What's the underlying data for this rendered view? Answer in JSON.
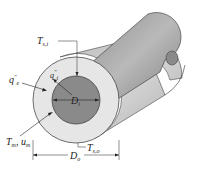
{
  "diagram": {
    "labels": {
      "T_si": {
        "main": "T",
        "sub": "s,i"
      },
      "q_e": {
        "main": "q",
        "sup": "\"",
        "sub": "e"
      },
      "q_i": {
        "main": "q",
        "sup": "\"",
        "sub": "i"
      },
      "D_i": {
        "main": "D",
        "sub": "i"
      },
      "T_m_u_m": {
        "main": "T",
        "sub": "m",
        "sep": ", ",
        "main2": "u",
        "sub2": "m"
      },
      "T_so": {
        "main": "T",
        "sub": "s,o"
      },
      "D_o": {
        "main": "D",
        "sub": "o"
      }
    },
    "colors": {
      "annulus_face": "#e6e6e6",
      "inner_tube_face": "#8a8a8a",
      "tube_body": "#9a9a9a",
      "outline": "#333333"
    }
  }
}
